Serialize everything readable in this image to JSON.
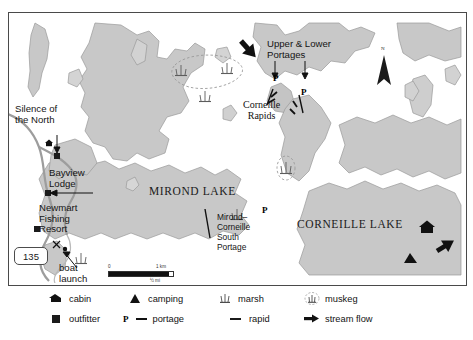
{
  "map": {
    "title": "Mirond Lake / Corneille Lake canoe route map",
    "water_color": "#ffffff",
    "land_color": "#c9c9c9",
    "frame_color": "#4a4a4a",
    "labels": {
      "mirond_lake": "MIROND LAKE",
      "corneille_lake": "CORNEILLE LAKE",
      "corneille_rapids": "Corneille\nRapids",
      "upper_lower_portages": "Upper & Lower\nPortages",
      "mirond_corneille_south_portage": "Mirond–\nCorneille\nSouth\nPortage",
      "silence_of_the_north": "Silence of\nthe North",
      "bayview_lodge": "Bayview\nLodge",
      "newmart_fishing_resort": "Newmart\nFishing\nResort",
      "boat_launch": "boat\nlaunch",
      "highway_shield": "135",
      "north_letter": "N"
    },
    "portage_markers": [
      {
        "label": "P"
      },
      {
        "label": "P"
      },
      {
        "label": "P"
      }
    ],
    "scale": {
      "zero": "0",
      "km": "1 km",
      "mi": "½ mi"
    }
  },
  "legend": {
    "rows": [
      [
        {
          "icon": "cabin-icon",
          "label": "cabin"
        },
        {
          "icon": "camping-icon",
          "label": "camping"
        },
        {
          "icon": "marsh-icon",
          "label": "marsh"
        },
        {
          "icon": "muskeg-icon",
          "label": "muskeg"
        }
      ],
      [
        {
          "icon": "outfitter-icon",
          "label": "outfitter"
        },
        {
          "icon": "portage-icon",
          "label": "portage",
          "prefix": "P"
        },
        {
          "icon": "rapid-icon",
          "label": "rapid"
        },
        {
          "icon": "stream-flow-icon",
          "label": "stream flow"
        }
      ]
    ]
  }
}
